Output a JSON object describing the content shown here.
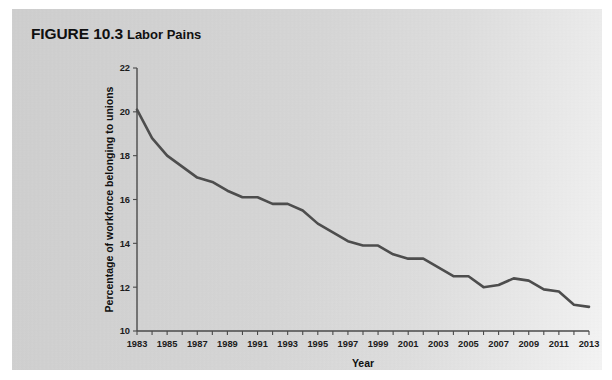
{
  "figure": {
    "number_label": "FIGURE 10.3",
    "name_label": "Labor Pains"
  },
  "colors": {
    "panel_background": "#d6d6d6",
    "line_color": "#4d4d4d",
    "axis_color": "#4a4a4a",
    "text_color": "#101010"
  },
  "chart_data": {
    "type": "line",
    "xlabel": "Year",
    "ylabel": "Percentage of workforce belonging to unions",
    "xlim": [
      1983,
      2013
    ],
    "ylim": [
      10,
      22
    ],
    "y_ticks": [
      10,
      12,
      14,
      16,
      18,
      20,
      22
    ],
    "y_tick_labels": [
      "10",
      "12",
      "14",
      "16",
      "18",
      "20",
      "22"
    ],
    "x_ticks": [
      1983,
      1984,
      1985,
      1986,
      1987,
      1988,
      1989,
      1990,
      1991,
      1992,
      1993,
      1994,
      1995,
      1996,
      1997,
      1998,
      1999,
      2000,
      2001,
      2002,
      2003,
      2004,
      2005,
      2006,
      2007,
      2008,
      2009,
      2010,
      2011,
      2012,
      2013
    ],
    "x_tick_labels": [
      "1983",
      "",
      "1985",
      "",
      "1987",
      "",
      "1989",
      "",
      "1991",
      "",
      "1993",
      "",
      "1995",
      "",
      "1997",
      "",
      "1999",
      "",
      "2001",
      "",
      "2003",
      "",
      "2005",
      "",
      "2007",
      "",
      "2009",
      "",
      "2011",
      "",
      "2013"
    ],
    "grid": false,
    "legend": false,
    "series": [
      {
        "name": "Percentage of workforce belonging to unions",
        "x": [
          1983,
          1984,
          1985,
          1986,
          1987,
          1988,
          1989,
          1990,
          1991,
          1992,
          1993,
          1994,
          1995,
          1996,
          1997,
          1998,
          1999,
          2000,
          2001,
          2002,
          2003,
          2004,
          2005,
          2006,
          2007,
          2008,
          2009,
          2010,
          2011,
          2012,
          2013
        ],
        "values": [
          20.1,
          18.8,
          18.0,
          17.5,
          17.0,
          16.8,
          16.4,
          16.1,
          16.1,
          15.8,
          15.8,
          15.5,
          14.9,
          14.5,
          14.1,
          13.9,
          13.9,
          13.5,
          13.3,
          13.3,
          12.9,
          12.5,
          12.5,
          12.0,
          12.1,
          12.4,
          12.3,
          11.9,
          11.8,
          11.2,
          11.1
        ]
      }
    ]
  }
}
